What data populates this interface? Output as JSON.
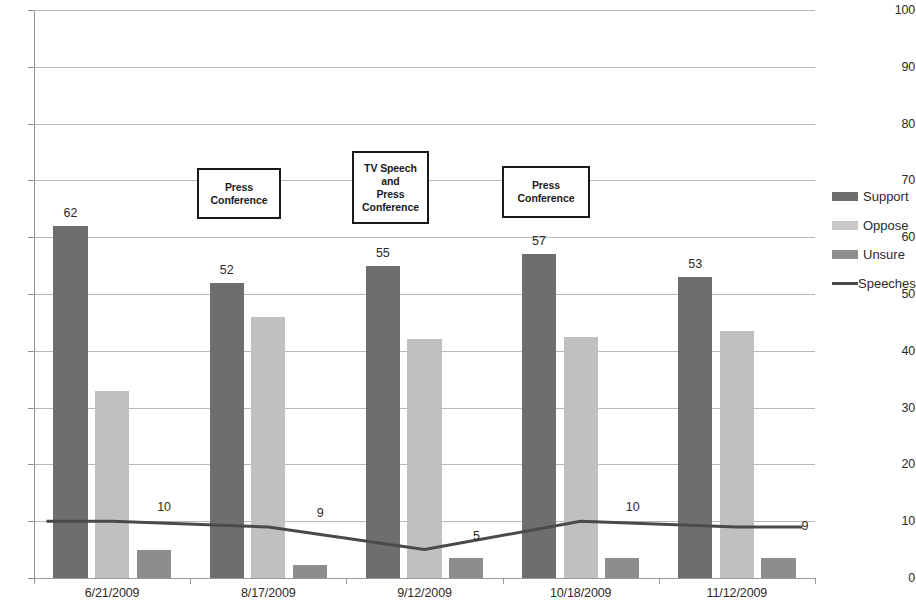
{
  "chart_data": {
    "type": "bar",
    "title": "",
    "subtitle": "",
    "xlabel": "",
    "ylabel": "",
    "ylim": [
      0,
      100
    ],
    "ytick_step": 10,
    "yticks": [
      0,
      10,
      20,
      30,
      40,
      50,
      60,
      70,
      80,
      90,
      100
    ],
    "grid": true,
    "legend_position": "right",
    "categories": [
      "6/21/2009",
      "8/17/2009",
      "9/12/2009",
      "10/18/2009",
      "11/12/2009"
    ],
    "series": [
      {
        "name": "Support",
        "type": "bar",
        "color": "#6e6e6e",
        "values": [
          62,
          52,
          55,
          57,
          53
        ],
        "labels": [
          "62",
          "52",
          "55",
          "57",
          "53"
        ]
      },
      {
        "name": "Oppose",
        "type": "bar",
        "color": "#c0c0c0",
        "values": [
          33,
          46,
          42,
          42.5,
          43.5
        ],
        "labels": [
          "",
          "",
          "",
          "",
          ""
        ]
      },
      {
        "name": "Unsure",
        "type": "bar",
        "color": "#8d8d8d",
        "values": [
          5,
          2.3,
          3.5,
          3.5,
          3.5
        ],
        "labels": [
          "",
          "",
          "",
          "",
          ""
        ]
      },
      {
        "name": "Speeches",
        "type": "line",
        "color": "#4a4a4a",
        "values": [
          10,
          9,
          5,
          10,
          9
        ],
        "labels": [
          "10",
          "9",
          "5",
          "10",
          "9"
        ]
      }
    ],
    "annotations": [
      {
        "id": "annotation-press-conference-1",
        "text": "Press\nConference",
        "near_category": "8/17/2009"
      },
      {
        "id": "annotation-tv-speech-press-conference",
        "text": "TV Speech\nand\nPress\nConference",
        "near_category": "9/12/2009"
      },
      {
        "id": "annotation-press-conference-2",
        "text": "Press\nConference",
        "near_category": "10/18/2009"
      }
    ]
  },
  "legend": {
    "items": [
      {
        "label": "Support",
        "swatch": "support"
      },
      {
        "label": "Oppose",
        "swatch": "oppose"
      },
      {
        "label": "Unsure",
        "swatch": "unsure"
      },
      {
        "label": "Speeches",
        "swatch": "line"
      }
    ]
  }
}
